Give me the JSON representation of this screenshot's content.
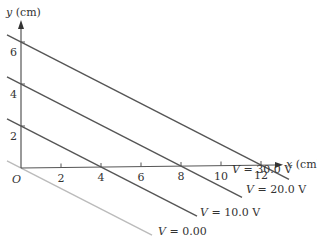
{
  "chart_data": {
    "type": "line",
    "title": "",
    "xlabel_var": "x",
    "xlabel_unit": " (cm)",
    "ylabel_var": "y",
    "ylabel_unit": " (cm)",
    "origin_label": "O",
    "xticks": [
      2,
      4,
      6,
      8,
      10,
      12
    ],
    "yticks": [
      2,
      4,
      6
    ],
    "xlim": [
      0,
      12.5
    ],
    "ylim": [
      0,
      6.5
    ],
    "series": [
      {
        "name": "V = 30.0 V",
        "var": "V",
        "value_text": " = 30.0 V",
        "x_intercept": 12,
        "y_intercept": 6,
        "color": "#555555"
      },
      {
        "name": "V = 20.0 V",
        "var": "V",
        "value_text": " = 20.0 V",
        "x_intercept": 8,
        "y_intercept": 4,
        "color": "#555555"
      },
      {
        "name": "V = 10.0 V",
        "var": "V",
        "value_text": " = 10.0 V",
        "x_intercept": 4,
        "y_intercept": 2,
        "color": "#555555"
      },
      {
        "name": "V = 0.00",
        "var": "V",
        "value_text": " = 0.00",
        "x_intercept": 0,
        "y_intercept": 0,
        "color": "#bbbbbb"
      }
    ]
  }
}
